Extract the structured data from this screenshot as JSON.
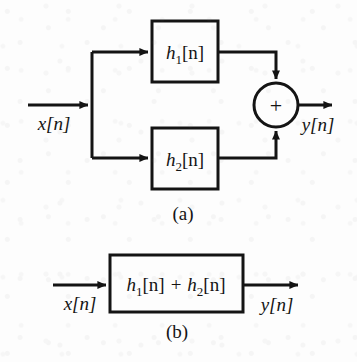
{
  "figure": {
    "background_color": "#fdfdfd",
    "ink_color": "#141414",
    "stroke_width": 3,
    "panels": [
      {
        "id": "panel-a",
        "caption": "(a)",
        "description": "Parallel interconnection of two LTI systems",
        "input_signal": "x[n]",
        "output_signal": "y[n]",
        "blocks": [
          {
            "id": "block-h1",
            "label_main": "h",
            "label_sub": "1",
            "label_tail": "[n]",
            "label_full": "h1[n]"
          },
          {
            "id": "block-h2",
            "label_main": "h",
            "label_sub": "2",
            "label_tail": "[n]",
            "label_full": "h2[n]"
          }
        ],
        "adder": {
          "id": "summing-junction",
          "symbol": "+"
        }
      },
      {
        "id": "panel-b",
        "caption": "(b)",
        "description": "Equivalent single-system representation",
        "input_signal": "x[n]",
        "output_signal": "y[n]",
        "blocks": [
          {
            "id": "block-h1-plus-h2",
            "term1_main": "h",
            "term1_sub": "1",
            "term1_tail": "[n]",
            "operator": "+",
            "term2_main": "h",
            "term2_sub": "2",
            "term2_tail": "[n]",
            "label_full": "h1[n] + h2[n]"
          }
        ]
      }
    ]
  }
}
